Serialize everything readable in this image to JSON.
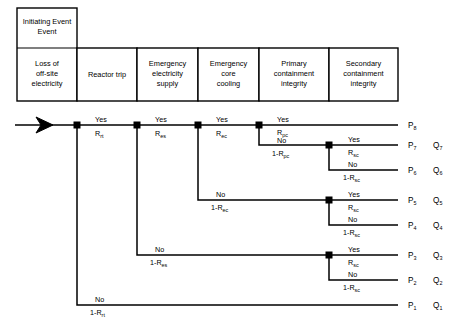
{
  "diagram": {
    "headers": {
      "initiating_event_label": "Initiating Event",
      "columns": [
        {
          "id": "initiating",
          "lines": [
            "Loss of",
            "off-site",
            "electricity"
          ],
          "x0": 17,
          "x1": 77
        },
        {
          "id": "reactor-trip",
          "lines": [
            "Reactor trip"
          ],
          "x0": 77,
          "x1": 137
        },
        {
          "id": "emergency-electricity-supply",
          "lines": [
            "Emergency",
            "electricity",
            "supply"
          ],
          "x0": 137,
          "x1": 198
        },
        {
          "id": "emergency-core-cooling",
          "lines": [
            "Emergency",
            "core",
            "cooling"
          ],
          "x0": 198,
          "x1": 259
        },
        {
          "id": "primary-containment-integrity",
          "lines": [
            "Primary",
            "containment",
            "integrity"
          ],
          "x0": 259,
          "x1": 329
        },
        {
          "id": "secondary-containment-integrity",
          "lines": [
            "Secondary",
            "containment",
            "integrity"
          ],
          "x0": 329,
          "x1": 398
        }
      ]
    },
    "branch_labels": {
      "rt_yes": {
        "top": "Yes",
        "bottom": "R",
        "bottom_sub": "rt"
      },
      "rt_no": {
        "top": "No",
        "bottom": "1-R",
        "bottom_sub": "rt"
      },
      "es_yes": {
        "top": "Yes",
        "bottom": "R",
        "bottom_sub": "es"
      },
      "es_no": {
        "top": "No",
        "bottom": "1-R",
        "bottom_sub": "es"
      },
      "ec_yes": {
        "top": "Yes",
        "bottom": "R",
        "bottom_sub": "ec"
      },
      "ec_no": {
        "top": "No",
        "bottom": "1-R",
        "bottom_sub": "ec"
      },
      "pc_yes": {
        "top": "Yes",
        "bottom": "R",
        "bottom_sub": "pc"
      },
      "pc_no": {
        "top": "No",
        "bottom": "1-R",
        "bottom_sub": "pc"
      },
      "sc_yes": {
        "top": "Yes",
        "bottom": "R",
        "bottom_sub": "sc"
      },
      "sc_no": {
        "top": "No",
        "bottom": "1-R",
        "bottom_sub": "sc"
      }
    },
    "outcomes": [
      {
        "id": "o8",
        "p": "P",
        "p_sub": "8",
        "q": "",
        "q_sub": "",
        "y": 125
      },
      {
        "id": "o7",
        "p": "P",
        "p_sub": "7",
        "q": "Q",
        "q_sub": "7",
        "y": 145
      },
      {
        "id": "o6",
        "p": "P",
        "p_sub": "6",
        "q": "Q",
        "q_sub": "6",
        "y": 170
      },
      {
        "id": "o5",
        "p": "P",
        "p_sub": "5",
        "q": "Q",
        "q_sub": "5",
        "y": 200
      },
      {
        "id": "o4",
        "p": "P",
        "p_sub": "4",
        "q": "Q",
        "q_sub": "4",
        "y": 225
      },
      {
        "id": "o3",
        "p": "P",
        "p_sub": "3",
        "q": "Q",
        "q_sub": "3",
        "y": 255
      },
      {
        "id": "o2",
        "p": "P",
        "p_sub": "2",
        "q": "Q",
        "q_sub": "2",
        "y": 280
      },
      {
        "id": "o1",
        "p": "P",
        "p_sub": "1",
        "q": "Q",
        "q_sub": "1",
        "y": 305
      }
    ],
    "nodes": [
      {
        "id": "node-rt",
        "x": 77,
        "y": 125
      },
      {
        "id": "node-es",
        "x": 137,
        "y": 125
      },
      {
        "id": "node-ec",
        "x": 198,
        "y": 125
      },
      {
        "id": "node-pc",
        "x": 259,
        "y": 125
      },
      {
        "id": "node-sc-top",
        "x": 329,
        "y": 145
      },
      {
        "id": "node-sc-mid",
        "x": 329,
        "y": 200
      },
      {
        "id": "node-sc-low",
        "x": 329,
        "y": 255
      }
    ],
    "colors": {
      "line": "#000000",
      "box_border": "#000000",
      "background": "#ffffff",
      "text": "#000000"
    },
    "entry_arrow": {
      "x_start": 15,
      "x_end": 77,
      "y": 125
    }
  }
}
